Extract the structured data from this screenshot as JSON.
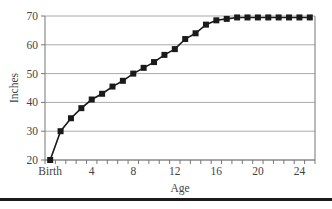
{
  "chart_data": {
    "type": "line",
    "title": "",
    "xlabel": "Age",
    "ylabel": "Inches",
    "x": [
      0,
      1,
      2,
      3,
      4,
      5,
      6,
      7,
      8,
      9,
      10,
      11,
      12,
      13,
      14,
      15,
      16,
      17,
      18,
      19,
      20,
      21,
      22,
      23,
      24,
      25
    ],
    "x_tick_labels": [
      {
        "value": 0,
        "label": "Birth"
      },
      {
        "value": 4,
        "label": "4"
      },
      {
        "value": 8,
        "label": "8"
      },
      {
        "value": 12,
        "label": "12"
      },
      {
        "value": 16,
        "label": "16"
      },
      {
        "value": 20,
        "label": "20"
      },
      {
        "value": 24,
        "label": "24"
      }
    ],
    "y_ticks": [
      20,
      30,
      40,
      50,
      60,
      70
    ],
    "ylim": [
      20,
      70
    ],
    "xlim": [
      -0.5,
      25.5
    ],
    "grid": "horizontal",
    "legend": "none",
    "series": [
      {
        "name": "Height",
        "marker": "square",
        "color": "#1a1a1a",
        "values": [
          20,
          30,
          34.5,
          38,
          41,
          43,
          45.5,
          47.5,
          50,
          52,
          54,
          56.5,
          58.5,
          62,
          64,
          67,
          68.5,
          69,
          69.5,
          69.5,
          69.5,
          69.5,
          69.5,
          69.5,
          69.5,
          69.5
        ]
      }
    ],
    "colors": {
      "gridline": "#aaaaaa",
      "axis": "#777777",
      "line": "#1a1a1a"
    }
  }
}
